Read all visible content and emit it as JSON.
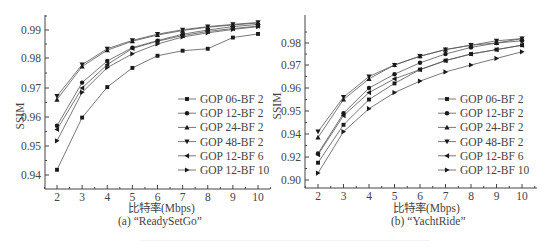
{
  "chart_data": [
    {
      "id": "a",
      "type": "line",
      "title": "",
      "caption": "(a) “ReadySetGo”",
      "xlabel": "比特率(Mbps)",
      "ylabel": "SSIM",
      "x": [
        2,
        3,
        4,
        5,
        6,
        7,
        8,
        9,
        10
      ],
      "xticks": [
        "2",
        "3",
        "4",
        "5",
        "6",
        "7",
        "8",
        "9",
        "10"
      ],
      "yticks": [
        "0.94",
        "0.95",
        "0.96",
        "0.97",
        "0.98",
        "0.99"
      ],
      "ylim": [
        0.935,
        0.995
      ],
      "grid": false,
      "legend_position": "lower right",
      "series": [
        {
          "name": "GOP 06-BF 2",
          "marker": "square",
          "values": [
            0.9418,
            0.9598,
            0.9703,
            0.9767,
            0.9808,
            0.9826,
            0.9833,
            0.9873,
            0.9886
          ]
        },
        {
          "name": "GOP 12-BF 2",
          "marker": "circle",
          "values": [
            0.957,
            0.9718,
            0.979,
            0.9837,
            0.9862,
            0.9885,
            0.99,
            0.9912,
            0.992
          ]
        },
        {
          "name": "GOP 24-BF 2",
          "marker": "triangle-up",
          "values": [
            0.966,
            0.9772,
            0.9828,
            0.986,
            0.9882,
            0.9898,
            0.991,
            0.9918,
            0.9925
          ]
        },
        {
          "name": "GOP 48-BF 2",
          "marker": "triangle-down",
          "values": [
            0.9672,
            0.9778,
            0.9833,
            0.9863,
            0.9885,
            0.9901,
            0.9912,
            0.992,
            0.9927
          ]
        },
        {
          "name": "GOP 12-BF 6",
          "marker": "triangle-left",
          "values": [
            0.9557,
            0.97,
            0.9778,
            0.9834,
            0.986,
            0.988,
            0.9895,
            0.9905,
            0.9914
          ]
        },
        {
          "name": "GOP 12-BF 10",
          "marker": "triangle-right",
          "values": [
            0.9518,
            0.9685,
            0.9768,
            0.9815,
            0.985,
            0.9875,
            0.989,
            0.9902,
            0.9912
          ]
        }
      ]
    },
    {
      "id": "b",
      "type": "line",
      "title": "",
      "caption": "(b) “YachtRide”",
      "xlabel": "比特率(Mbps)",
      "ylabel": "SSIM",
      "x": [
        2,
        3,
        4,
        5,
        6,
        7,
        8,
        9,
        10
      ],
      "xticks": [
        "2",
        "3",
        "4",
        "5",
        "6",
        "7",
        "8",
        "9",
        "10"
      ],
      "yticks": [
        "0.90",
        "0.92",
        "0.94",
        "0.95",
        "0.96",
        "0.97",
        "0.98"
      ],
      "ylim": [
        0.895,
        0.99
      ],
      "grid": false,
      "legend_position": "lower right",
      "note": "y tick labels are evenly spaced but not evenly valued; values below 0.94 read on label scale",
      "series": [
        {
          "name": "GOP 06-BF 2",
          "marker": "square",
          "values": [
            0.915,
            0.944,
            0.955,
            0.962,
            0.968,
            0.972,
            0.975,
            0.977,
            0.979
          ]
        },
        {
          "name": "GOP 12-BF 2",
          "marker": "circle",
          "values": [
            0.923,
            0.949,
            0.96,
            0.966,
            0.971,
            0.975,
            0.978,
            0.98,
            0.981
          ]
        },
        {
          "name": "GOP 24-BF 2",
          "marker": "triangle-up",
          "values": [
            0.937,
            0.955,
            0.964,
            0.97,
            0.974,
            0.977,
            0.979,
            0.98,
            0.982
          ]
        },
        {
          "name": "GOP 48-BF 2",
          "marker": "triangle-down",
          "values": [
            0.941,
            0.956,
            0.965,
            0.97,
            0.974,
            0.977,
            0.979,
            0.981,
            0.982
          ]
        },
        {
          "name": "GOP 12-BF 6",
          "marker": "triangle-left",
          "values": [
            0.922,
            0.948,
            0.958,
            0.964,
            0.968,
            0.972,
            0.975,
            0.977,
            0.979
          ]
        },
        {
          "name": "GOP 12-BF 10",
          "marker": "triangle-right",
          "values": [
            0.906,
            0.941,
            0.951,
            0.958,
            0.963,
            0.967,
            0.97,
            0.973,
            0.976
          ]
        }
      ]
    }
  ],
  "panels": {
    "a": {
      "xlabel": "比特率(Mbps)",
      "ylabel": "SSIM",
      "caption": "(a) “ReadySetGo”"
    },
    "b": {
      "xlabel": "比特率(Mbps)",
      "ylabel": "SSIM",
      "caption": "(b) “YachtRide”"
    }
  },
  "colors": {
    "line": "#555555",
    "marker": "#1a1a1a",
    "axis": "#444444",
    "text": "#444444"
  }
}
